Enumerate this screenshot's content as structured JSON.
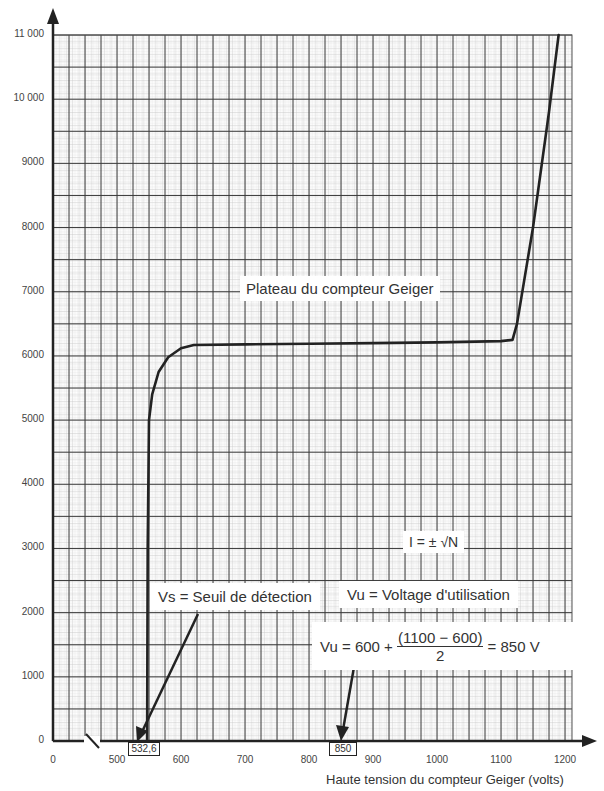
{
  "chart_data": {
    "type": "line",
    "title": "",
    "xlabel": "Haute tension du compteur Geiger (volts)",
    "ylabel": "",
    "x_ticks": [
      "0",
      "500",
      "600",
      "700",
      "800",
      "900",
      "1000",
      "1100",
      "1200"
    ],
    "y_ticks": [
      "0",
      "1000",
      "2000",
      "3000",
      "4000",
      "5000",
      "6000",
      "7000",
      "8000",
      "9000",
      "10 000",
      "11 000"
    ],
    "xlim": [
      500,
      1200
    ],
    "ylim": [
      0,
      11000
    ],
    "x_axis_break": "between 0 and 500",
    "grid": true,
    "series": [
      {
        "name": "Plateau du compteur Geiger",
        "x": [
          547,
          548,
          550,
          555,
          565,
          580,
          600,
          620,
          700,
          800,
          900,
          1000,
          1100,
          1118,
          1125,
          1150,
          1175,
          1190
        ],
        "y": [
          0,
          3000,
          5000,
          5400,
          5750,
          5980,
          6120,
          6170,
          6180,
          6190,
          6200,
          6210,
          6230,
          6250,
          6500,
          8000,
          9800,
          11000
        ]
      }
    ],
    "annotations": {
      "plateau": "Plateau du compteur Geiger",
      "uncertainty": "I = ± √N",
      "vs": "Vs = Seuil de détection",
      "vu": "Vu = Voltage d'utilisation",
      "formula_left": "Vu = 600 + ",
      "formula_num": "(1100 − 600)",
      "formula_den": "2",
      "formula_right": " = 850 V",
      "vs_value": "532,6",
      "vu_value": "850"
    }
  }
}
